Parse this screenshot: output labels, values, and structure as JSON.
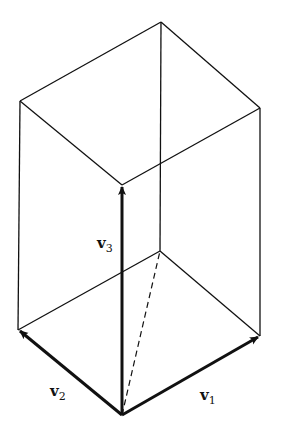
{
  "diagram": {
    "type": "parallelepiped-with-basis-vectors",
    "line_color": "#111111",
    "vertices": {
      "origin": [
        122,
        415
      ],
      "v1_tip": [
        260,
        336
      ],
      "v2_tip": [
        18,
        330
      ],
      "v3_tip": [
        122,
        185
      ],
      "v1v2": [
        160,
        251
      ],
      "v1v3": [
        260,
        108
      ],
      "v2v3": [
        20,
        101
      ],
      "v1v2v3": [
        161,
        22
      ]
    },
    "labels": {
      "v1": {
        "base": "v",
        "sub": "1"
      },
      "v2": {
        "base": "v",
        "sub": "2"
      },
      "v3": {
        "base": "v",
        "sub": "3"
      }
    }
  }
}
